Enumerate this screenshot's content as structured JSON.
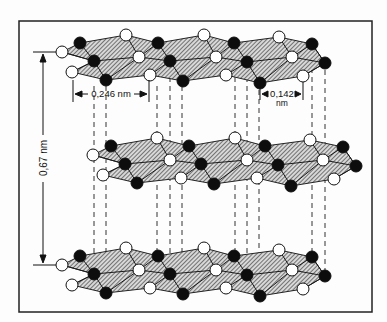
{
  "diagram": {
    "labels": {
      "in_plane_lattice": "0,246 nm",
      "bond_length_value": "0,142",
      "bond_length_unit": "nm",
      "interlayer_spacing": "0,67 nm"
    },
    "legend_implied": {
      "white_atom": "atom type A (open circle)",
      "black_atom": "atom type B (filled circle)"
    },
    "layers": 3,
    "colors": {
      "frame": "#222222",
      "atom_black": "#0d0d0d",
      "atom_white": "#ffffff",
      "hatch": "#444444",
      "dashed": "#333333"
    }
  }
}
